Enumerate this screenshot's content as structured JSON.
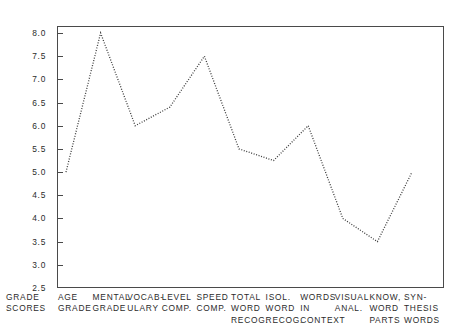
{
  "chart_data": {
    "type": "line",
    "title": "",
    "subtitle": "",
    "xlabel": "",
    "ylabel": "GRADE SCORES",
    "categories": [
      "AGE GRADE",
      "MENTAL GRADE",
      "VOCAB-ULARY",
      "LEVEL COMP.",
      "SPEED COMP.",
      "TOTAL WORD RECOG.",
      "ISOL. WORD RECOG.",
      "WORDS IN CONTEXT",
      "VISUAL ANAL.",
      "KNOW, WORD PARTS",
      "SYN-THESIS WORDS"
    ],
    "values": [
      5.0,
      8.0,
      6.0,
      6.4,
      7.5,
      5.5,
      5.25,
      6.0,
      4.0,
      3.5,
      5.0
    ],
    "ylim": [
      2.5,
      8.0
    ],
    "ytick_labels": [
      "8.0",
      "7.5",
      "7.0",
      "6.5",
      "6.0",
      "5.5",
      "5.0",
      "4.5",
      "4.0",
      "3.5",
      "3.0",
      "2.5"
    ],
    "ytick_values": [
      8.0,
      7.5,
      7.0,
      6.5,
      6.0,
      5.5,
      5.0,
      4.5,
      4.0,
      3.5,
      3.0,
      2.5
    ],
    "grid": false,
    "legend": false,
    "line_style": "dotted",
    "line_color": "#3c3c3c",
    "frame_color": "#4a4a4a",
    "background_color": "#ffffff"
  },
  "axis": {
    "y_title_lines": [
      "GRADE",
      "SCORES"
    ]
  },
  "x_axis_labels": [
    {
      "lines": [
        "AGE",
        "GRADE"
      ]
    },
    {
      "lines": [
        "MENTAL",
        "GRADE"
      ]
    },
    {
      "lines": [
        "VOCAB-",
        "ULARY"
      ]
    },
    {
      "lines": [
        "LEVEL",
        "COMP."
      ]
    },
    {
      "lines": [
        "SPEED",
        "COMP."
      ]
    },
    {
      "lines": [
        "TOTAL",
        "WORD",
        "RECOG."
      ]
    },
    {
      "lines": [
        "ISOL.",
        "WORD",
        "RECOG."
      ]
    },
    {
      "lines": [
        "WORDS",
        "IN",
        "CONTEXT"
      ]
    },
    {
      "lines": [
        "VISUAL",
        "ANAL."
      ]
    },
    {
      "lines": [
        "KNOW,",
        "WORD",
        "PARTS"
      ]
    },
    {
      "lines": [
        "SYN-",
        "THESIS",
        "WORDS"
      ]
    }
  ]
}
